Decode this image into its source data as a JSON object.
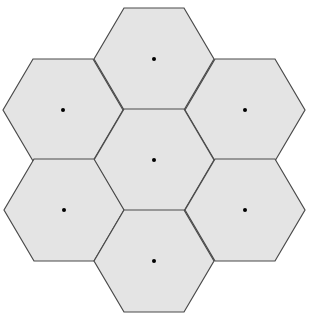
{
  "diagram": {
    "type": "hexagonal-cell-cluster",
    "cell_count": 7,
    "colors": {
      "fill": "#e4e4e4",
      "stroke": "#4a4a4a",
      "dot": "#000000",
      "background": "#ffffff"
    },
    "hex": {
      "radius": 60,
      "half_height": 51
    },
    "cells": [
      {
        "id": "top",
        "cx": 154,
        "cy": 59
      },
      {
        "id": "upper-left",
        "cx": 63,
        "cy": 110
      },
      {
        "id": "upper-right",
        "cx": 245,
        "cy": 110
      },
      {
        "id": "center",
        "cx": 154,
        "cy": 160
      },
      {
        "id": "lower-left",
        "cx": 64,
        "cy": 210
      },
      {
        "id": "lower-right",
        "cx": 245,
        "cy": 210
      },
      {
        "id": "bottom",
        "cx": 154,
        "cy": 261
      }
    ]
  }
}
